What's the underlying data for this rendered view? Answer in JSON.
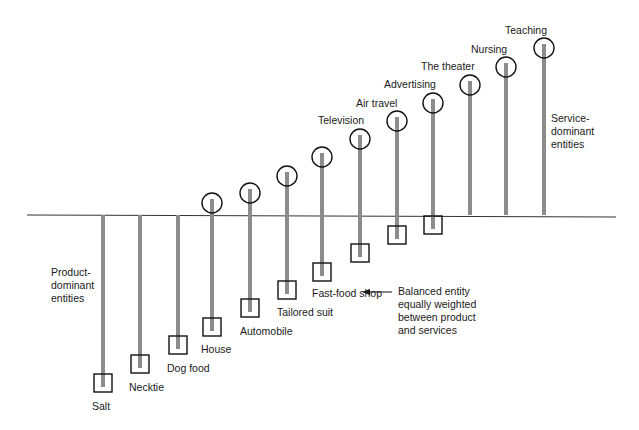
{
  "diagram": {
    "baseline_y": 215,
    "colors": {
      "bar": "#8c8c8c",
      "stroke": "#111111",
      "baseline": "#333333"
    },
    "entities": [
      {
        "label": "Salt",
        "x": 103,
        "box_y": 383,
        "circle_y": null,
        "label_x": 92,
        "label_y": 400
      },
      {
        "label": "Necktie",
        "x": 140,
        "box_y": 364,
        "circle_y": null,
        "label_x": 129,
        "label_y": 381
      },
      {
        "label": "Dog food",
        "x": 178,
        "box_y": 345,
        "circle_y": null,
        "label_x": 167,
        "label_y": 362
      },
      {
        "label": "House",
        "x": 212,
        "box_y": 327,
        "circle_y": 203,
        "label_x": 201,
        "label_y": 343
      },
      {
        "label": "Automobile",
        "x": 250,
        "box_y": 308,
        "circle_y": 193,
        "label_x": 240,
        "label_y": 325
      },
      {
        "label": "Tailored suit",
        "x": 287,
        "box_y": 290,
        "circle_y": 176,
        "label_x": 277,
        "label_y": 306
      },
      {
        "label": "Fast-food shop",
        "x": 322,
        "box_y": 272,
        "circle_y": 157,
        "label_x": 312,
        "label_y": 287
      },
      {
        "label": "Television",
        "x": 360,
        "box_y": 253,
        "circle_y": 139,
        "label_x": 318,
        "label_y": 114
      },
      {
        "label": "Air travel",
        "x": 397,
        "box_y": 235,
        "circle_y": 121,
        "label_x": 356,
        "label_y": 97
      },
      {
        "label": "Advertising",
        "x": 433,
        "box_y": 225,
        "circle_y": 103,
        "label_x": 384,
        "label_y": 78
      },
      {
        "label": "The theater",
        "x": 470,
        "box_y": null,
        "circle_y": 85,
        "label_x": 421,
        "label_y": 60
      },
      {
        "label": "Nursing",
        "x": 506,
        "box_y": null,
        "circle_y": 67,
        "label_x": 471,
        "label_y": 43
      },
      {
        "label": "Teaching",
        "x": 544,
        "box_y": null,
        "circle_y": 48,
        "label_x": 505,
        "label_y": 24
      }
    ],
    "annotations": {
      "product_dominant": "Product-\ndominant\nentities",
      "service_dominant": "Service-\ndominant\nentities",
      "balanced": "Balanced entity\nequally weighted\nbetween product\nand services"
    }
  }
}
